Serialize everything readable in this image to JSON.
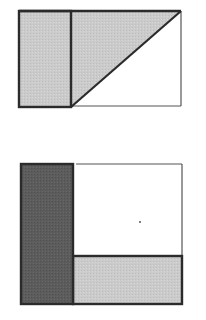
{
  "colors": {
    "background": "#ffffff",
    "stroke": "#2b2b2b",
    "thin_stroke": "#4a4a4a",
    "light_fill": "#c8c8c8",
    "dark_fill": "#5a5a5a",
    "white_fill": "#ffffff"
  },
  "figures": [
    {
      "id": "figure-top",
      "description": "Rectangle divided into a shaded left strip and a shaded triangle above the diagonal; lower-right triangle unshaded",
      "outer_rect": {
        "x": 19,
        "y": 11,
        "w": 162,
        "h": 96
      },
      "shaded_strip": {
        "x": 19,
        "y": 11,
        "w": 52,
        "h": 96,
        "shade": "light"
      },
      "shaded_triangle": {
        "points": [
          [
            71,
            11
          ],
          [
            181,
            11
          ],
          [
            71,
            107
          ]
        ],
        "shade": "light"
      },
      "unshaded_triangle": {
        "points": [
          [
            71,
            107
          ],
          [
            181,
            11
          ],
          [
            181,
            107
          ]
        ],
        "shade": "none"
      }
    },
    {
      "id": "figure-bottom",
      "description": "Rectangle with a dark left strip, a light bottom strip, and an unshaded upper-right region containing a small dot",
      "outer_rect": {
        "x": 21,
        "y": 164,
        "w": 161,
        "h": 140
      },
      "dark_strip": {
        "x": 21,
        "y": 164,
        "w": 52,
        "h": 140,
        "shade": "dark"
      },
      "light_strip": {
        "x": 73,
        "y": 256,
        "w": 109,
        "h": 48,
        "shade": "light"
      },
      "unshaded_region": {
        "x": 73,
        "y": 164,
        "w": 109,
        "h": 92,
        "shade": "none"
      },
      "dot": {
        "x": 140,
        "y": 222
      }
    }
  ]
}
